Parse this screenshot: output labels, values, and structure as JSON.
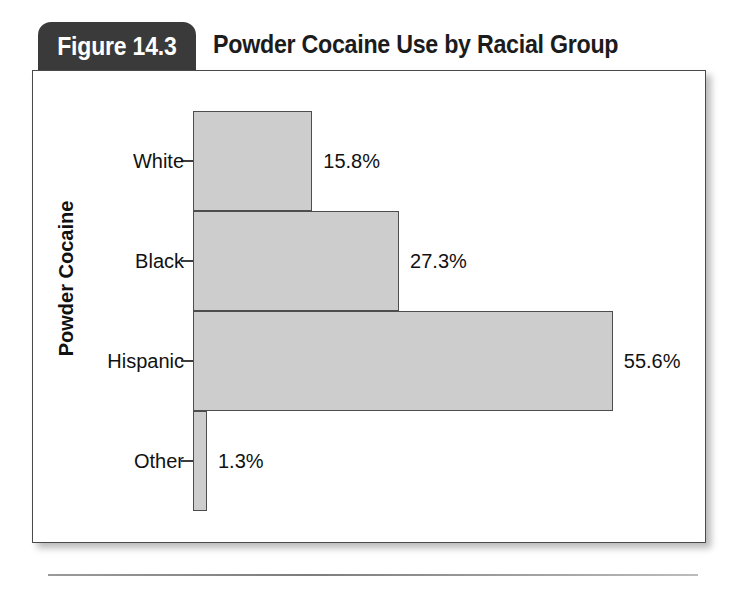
{
  "figure": {
    "badge_label": "Figure 14.3",
    "title": "Powder Cocaine Use by Racial Group"
  },
  "chart_data": {
    "type": "bar",
    "orientation": "horizontal",
    "title": "Powder Cocaine Use by Racial Group",
    "xlabel": "",
    "ylabel": "Powder Cocaine",
    "categories": [
      "White",
      "Black",
      "Hispanic",
      "Other"
    ],
    "values": [
      15.8,
      27.3,
      55.6,
      1.3
    ],
    "value_labels": [
      "15.8%",
      "27.3%",
      "55.6%",
      "1.3%"
    ],
    "units": "percent",
    "xlim": [
      0,
      60
    ],
    "grid": false,
    "legend": null,
    "bar_fill_color": "#cdcdcd",
    "bar_border_color": "#4d4d4d",
    "axis_color": "#3d3d3d",
    "text_color": "#111111"
  },
  "style": {
    "badge_bg": "#3a3a3a",
    "badge_text": "#ffffff",
    "frame_border": "#4a4a4a"
  }
}
